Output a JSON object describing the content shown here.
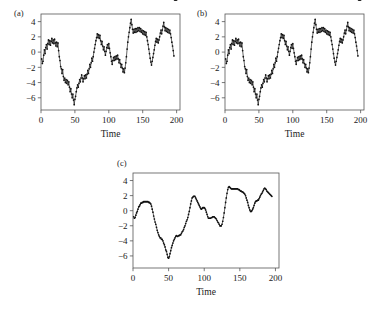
{
  "figure": {
    "background": "#ffffff",
    "ink_color": "#111111",
    "frame_color": "#555555"
  },
  "panels": [
    {
      "id": "a",
      "label": "(a)"
    },
    {
      "id": "b",
      "label": "(b)"
    },
    {
      "id": "c",
      "label": "(c)"
    }
  ],
  "chart_data": [
    {
      "type": "line",
      "panel": "(a)",
      "title": "",
      "xlabel": "Time",
      "ylabel": "",
      "xlim": [
        0,
        205
      ],
      "ylim": [
        -7.6,
        5.0
      ],
      "xticks": [
        0,
        50,
        100,
        150,
        200
      ],
      "yticks": [
        4,
        2,
        0,
        -2,
        -4,
        -6
      ],
      "xticklabels": [
        "0",
        "50",
        "100",
        "150",
        "200"
      ],
      "yticklabels": [
        "4",
        "2",
        "0",
        "-2",
        "-4",
        "-6"
      ],
      "grid": false,
      "legend": null,
      "marker": "dot",
      "x": [
        1,
        2,
        3,
        4,
        5,
        6,
        7,
        8,
        9,
        10,
        11,
        12,
        13,
        14,
        15,
        16,
        17,
        18,
        19,
        20,
        21,
        22,
        23,
        24,
        25,
        26,
        27,
        28,
        29,
        30,
        31,
        32,
        33,
        34,
        35,
        36,
        37,
        38,
        39,
        40,
        41,
        42,
        43,
        44,
        45,
        46,
        47,
        48,
        49,
        50,
        51,
        52,
        53,
        54,
        55,
        56,
        57,
        58,
        59,
        60,
        61,
        62,
        63,
        64,
        65,
        66,
        67,
        68,
        69,
        70,
        71,
        72,
        73,
        74,
        75,
        76,
        77,
        78,
        79,
        80,
        81,
        82,
        83,
        84,
        85,
        86,
        87,
        88,
        89,
        90,
        91,
        92,
        93,
        94,
        95,
        96,
        97,
        98,
        99,
        100,
        101,
        102,
        103,
        104,
        105,
        106,
        107,
        108,
        109,
        110,
        111,
        112,
        113,
        114,
        115,
        116,
        117,
        118,
        119,
        120,
        121,
        122,
        123,
        124,
        125,
        126,
        127,
        128,
        129,
        130,
        131,
        132,
        133,
        134,
        135,
        136,
        137,
        138,
        139,
        140,
        141,
        142,
        143,
        144,
        145,
        146,
        147,
        148,
        149,
        150,
        151,
        152,
        153,
        154,
        155,
        156,
        157,
        158,
        159,
        160,
        161,
        162,
        163,
        164,
        165,
        166,
        167,
        168,
        169,
        170,
        171,
        172,
        173,
        174,
        175,
        176,
        177,
        178,
        179,
        180,
        181,
        182,
        183,
        184,
        185,
        186,
        187,
        188,
        189,
        190,
        191,
        192,
        193,
        194,
        195,
        196,
        197,
        198,
        199,
        200
      ],
      "values": [
        -0.9,
        -1.5,
        -1.2,
        -0.4,
        0.3,
        -0.2,
        0.6,
        1.0,
        0.4,
        1.1,
        1.6,
        1.0,
        1.5,
        0.9,
        1.4,
        1.8,
        1.2,
        1.6,
        1.1,
        1.7,
        1.2,
        0.8,
        1.3,
        0.7,
        1.2,
        0.2,
        -0.6,
        -1.1,
        -1.9,
        -2.2,
        -2.8,
        -2.3,
        -3.2,
        -3.7,
        -3.4,
        -4.0,
        -3.6,
        -4.1,
        -3.7,
        -4.3,
        -3.9,
        -4.6,
        -5.2,
        -4.8,
        -5.5,
        -6.0,
        -5.5,
        -6.3,
        -6.9,
        -6.2,
        -5.8,
        -5.2,
        -4.7,
        -4.3,
        -4.6,
        -4.1,
        -3.6,
        -3.9,
        -3.4,
        -3.0,
        -3.4,
        -3.9,
        -3.5,
        -3.1,
        -3.5,
        -3.0,
        -3.4,
        -2.9,
        -2.4,
        -2.8,
        -2.2,
        -1.6,
        -2.0,
        -1.4,
        -0.8,
        -1.2,
        -0.6,
        0.0,
        0.5,
        1.0,
        1.5,
        1.9,
        2.4,
        1.9,
        2.3,
        1.8,
        2.2,
        1.5,
        1.0,
        1.4,
        0.8,
        0.3,
        0.7,
        0.1,
        -0.4,
        0.1,
        0.6,
        1.0,
        0.5,
        1.1,
        0.5,
        -0.1,
        -0.6,
        -1.2,
        -1.6,
        -1.1,
        -0.7,
        -1.1,
        -0.6,
        -1.0,
        -0.5,
        -0.9,
        -0.4,
        -0.9,
        -1.4,
        -1.0,
        -1.5,
        -2.0,
        -1.6,
        -2.1,
        -2.6,
        -2.2,
        -2.7,
        -2.1,
        -1.4,
        -0.6,
        0.4,
        1.3,
        2.0,
        2.6,
        3.2,
        3.8,
        4.3,
        3.6,
        3.0,
        2.5,
        3.0,
        2.6,
        3.1,
        2.6,
        3.1,
        2.7,
        3.2,
        2.8,
        3.2,
        2.7,
        3.1,
        2.6,
        2.9,
        2.4,
        2.8,
        2.3,
        2.7,
        2.2,
        2.6,
        2.0,
        1.5,
        1.0,
        0.4,
        -0.2,
        -0.8,
        -1.3,
        -1.7,
        -1.2,
        -0.7,
        -0.2,
        0.3,
        0.9,
        1.4,
        1.8,
        1.3,
        1.7,
        1.2,
        1.6,
        2.0,
        2.5,
        2.9,
        2.4,
        2.9,
        3.4,
        3.9,
        3.3,
        2.8,
        3.2,
        2.7,
        3.1,
        2.6,
        3.0,
        2.5,
        2.9,
        2.4,
        1.9,
        1.3,
        0.8,
        0.2,
        -0.5
      ]
    },
    {
      "type": "line",
      "panel": "(b)",
      "title": "",
      "xlabel": "Time",
      "ylabel": "",
      "xlim": [
        0,
        205
      ],
      "ylim": [
        -7.6,
        5.0
      ],
      "xticks": [
        0,
        50,
        100,
        150,
        200
      ],
      "yticks": [
        4,
        2,
        0,
        -2,
        -4,
        -6
      ],
      "xticklabels": [
        "0",
        "50",
        "100",
        "150",
        "200"
      ],
      "yticklabels": [
        "4",
        "2",
        "0",
        "-2",
        "-4",
        "-6"
      ],
      "grid": false,
      "legend": null,
      "marker": "dot",
      "x": [
        1,
        2,
        3,
        4,
        5,
        6,
        7,
        8,
        9,
        10,
        11,
        12,
        13,
        14,
        15,
        16,
        17,
        18,
        19,
        20,
        21,
        22,
        23,
        24,
        25,
        26,
        27,
        28,
        29,
        30,
        31,
        32,
        33,
        34,
        35,
        36,
        37,
        38,
        39,
        40,
        41,
        42,
        43,
        44,
        45,
        46,
        47,
        48,
        49,
        50,
        51,
        52,
        53,
        54,
        55,
        56,
        57,
        58,
        59,
        60,
        61,
        62,
        63,
        64,
        65,
        66,
        67,
        68,
        69,
        70,
        71,
        72,
        73,
        74,
        75,
        76,
        77,
        78,
        79,
        80,
        81,
        82,
        83,
        84,
        85,
        86,
        87,
        88,
        89,
        90,
        91,
        92,
        93,
        94,
        95,
        96,
        97,
        98,
        99,
        100,
        101,
        102,
        103,
        104,
        105,
        106,
        107,
        108,
        109,
        110,
        111,
        112,
        113,
        114,
        115,
        116,
        117,
        118,
        119,
        120,
        121,
        122,
        123,
        124,
        125,
        126,
        127,
        128,
        129,
        130,
        131,
        132,
        133,
        134,
        135,
        136,
        137,
        138,
        139,
        140,
        141,
        142,
        143,
        144,
        145,
        146,
        147,
        148,
        149,
        150,
        151,
        152,
        153,
        154,
        155,
        156,
        157,
        158,
        159,
        160,
        161,
        162,
        163,
        164,
        165,
        166,
        167,
        168,
        169,
        170,
        171,
        172,
        173,
        174,
        175,
        176,
        177,
        178,
        179,
        180,
        181,
        182,
        183,
        184,
        185,
        186,
        187,
        188,
        189,
        190,
        191,
        192,
        193,
        194,
        195,
        196,
        197,
        198,
        199,
        200
      ],
      "values": [
        -0.9,
        -1.5,
        -1.2,
        -0.4,
        0.3,
        -0.2,
        0.6,
        1.0,
        0.4,
        1.1,
        1.6,
        1.0,
        1.5,
        0.9,
        1.4,
        1.8,
        1.2,
        1.6,
        1.1,
        1.7,
        1.2,
        0.8,
        1.3,
        0.7,
        1.2,
        0.2,
        -0.6,
        -1.1,
        -1.9,
        -2.2,
        -2.8,
        -2.3,
        -3.2,
        -3.7,
        -3.4,
        -4.0,
        -3.6,
        -4.1,
        -3.7,
        -4.3,
        -3.9,
        -4.6,
        -5.2,
        -4.8,
        -5.5,
        -6.0,
        -5.5,
        -6.3,
        -6.9,
        -6.2,
        -5.8,
        -5.2,
        -4.7,
        -4.3,
        -4.6,
        -4.1,
        -3.6,
        -3.9,
        -3.4,
        -3.0,
        -3.4,
        -3.9,
        -3.5,
        -3.1,
        -3.5,
        -3.0,
        -3.4,
        -2.9,
        -2.4,
        -2.8,
        -2.2,
        -1.6,
        -2.0,
        -1.4,
        -0.8,
        -1.2,
        -0.6,
        0.0,
        0.5,
        1.0,
        1.5,
        1.9,
        2.4,
        1.9,
        2.3,
        1.8,
        2.2,
        1.5,
        1.0,
        1.4,
        0.8,
        0.3,
        0.7,
        0.1,
        -0.4,
        0.1,
        0.6,
        1.0,
        0.5,
        1.1,
        0.5,
        -0.1,
        -0.6,
        -1.2,
        -1.6,
        -1.1,
        -0.7,
        -1.1,
        -0.6,
        -1.0,
        -0.5,
        -0.9,
        -0.4,
        -0.9,
        -1.4,
        -1.0,
        -1.5,
        -2.0,
        -1.6,
        -2.1,
        -2.6,
        -2.2,
        -2.7,
        -2.1,
        -1.4,
        -0.6,
        0.4,
        1.3,
        2.0,
        2.6,
        3.2,
        3.8,
        4.3,
        3.6,
        3.0,
        2.5,
        3.0,
        2.6,
        3.1,
        2.6,
        3.1,
        2.7,
        3.2,
        2.8,
        3.2,
        2.7,
        3.1,
        2.6,
        2.9,
        2.4,
        2.8,
        2.3,
        2.7,
        2.2,
        2.6,
        2.0,
        1.5,
        1.0,
        0.4,
        -0.2,
        -0.8,
        -1.3,
        -1.7,
        -1.2,
        -0.7,
        -0.2,
        0.3,
        0.9,
        1.4,
        1.8,
        1.3,
        1.7,
        1.2,
        1.6,
        2.0,
        2.5,
        2.9,
        2.4,
        2.9,
        3.4,
        3.9,
        3.3,
        2.8,
        3.2,
        2.7,
        3.1,
        2.6,
        3.0,
        2.5,
        2.9,
        2.4,
        1.9,
        1.3,
        0.8,
        0.2,
        -0.5
      ]
    },
    {
      "type": "line",
      "panel": "(c)",
      "title": "",
      "xlabel": "Time",
      "ylabel": "",
      "xlim": [
        0,
        205
      ],
      "ylim": [
        -7.6,
        5.0
      ],
      "xticks": [
        0,
        50,
        100,
        150,
        200
      ],
      "yticks": [
        4,
        2,
        0,
        -2,
        -4,
        -6
      ],
      "xticklabels": [
        "0",
        "50",
        "100",
        "150",
        "200"
      ],
      "yticklabels": [
        "4",
        "2",
        "0",
        "-2",
        "-4",
        "-6"
      ],
      "grid": false,
      "legend": null,
      "marker": "dot",
      "note": "smoothed version of the series in panels (a) and (b)",
      "x": [
        1,
        2,
        3,
        4,
        5,
        6,
        7,
        8,
        9,
        10,
        11,
        12,
        13,
        14,
        15,
        16,
        17,
        18,
        19,
        20,
        21,
        22,
        23,
        24,
        25,
        26,
        27,
        28,
        29,
        30,
        31,
        32,
        33,
        34,
        35,
        36,
        37,
        38,
        39,
        40,
        41,
        42,
        43,
        44,
        45,
        46,
        47,
        48,
        49,
        50,
        51,
        52,
        53,
        54,
        55,
        56,
        57,
        58,
        59,
        60,
        61,
        62,
        63,
        64,
        65,
        66,
        67,
        68,
        69,
        70,
        71,
        72,
        73,
        74,
        75,
        76,
        77,
        78,
        79,
        80,
        81,
        82,
        83,
        84,
        85,
        86,
        87,
        88,
        89,
        90,
        91,
        92,
        93,
        94,
        95,
        96,
        97,
        98,
        99,
        100,
        101,
        102,
        103,
        104,
        105,
        106,
        107,
        108,
        109,
        110,
        111,
        112,
        113,
        114,
        115,
        116,
        117,
        118,
        119,
        120,
        121,
        122,
        123,
        124,
        125,
        126,
        127,
        128,
        129,
        130,
        131,
        132,
        133,
        134,
        135,
        136,
        137,
        138,
        139,
        140,
        141,
        142,
        143,
        144,
        145,
        146,
        147,
        148,
        149,
        150,
        151,
        152,
        153,
        154,
        155,
        156,
        157,
        158,
        159,
        160,
        161,
        162,
        163,
        164,
        165,
        166,
        167,
        168,
        169,
        170,
        171,
        172,
        173,
        174,
        175,
        176,
        177,
        178,
        179,
        180,
        181,
        182,
        183,
        184,
        185,
        186,
        187,
        188,
        189,
        190,
        191,
        192,
        193,
        194,
        195
      ],
      "values": [
        -0.8,
        -1.0,
        -0.9,
        -0.6,
        -0.3,
        -0.1,
        0.2,
        0.5,
        0.6,
        0.8,
        1.0,
        1.0,
        1.1,
        1.1,
        1.2,
        1.2,
        1.2,
        1.2,
        1.2,
        1.2,
        1.2,
        1.1,
        1.1,
        1.0,
        0.9,
        0.6,
        0.2,
        -0.2,
        -0.7,
        -1.1,
        -1.5,
        -1.8,
        -2.2,
        -2.6,
        -2.9,
        -3.2,
        -3.4,
        -3.6,
        -3.6,
        -3.8,
        -3.8,
        -4.0,
        -4.3,
        -4.5,
        -4.8,
        -5.2,
        -5.4,
        -5.8,
        -6.2,
        -6.3,
        -6.1,
        -5.7,
        -5.3,
        -4.9,
        -4.6,
        -4.3,
        -4.0,
        -3.8,
        -3.6,
        -3.4,
        -3.3,
        -3.4,
        -3.4,
        -3.3,
        -3.3,
        -3.2,
        -3.2,
        -3.0,
        -2.8,
        -2.7,
        -2.5,
        -2.2,
        -2.0,
        -1.7,
        -1.4,
        -1.2,
        -0.9,
        -0.5,
        -0.1,
        0.4,
        0.9,
        1.3,
        1.7,
        1.8,
        1.9,
        1.9,
        1.9,
        1.7,
        1.5,
        1.3,
        1.1,
        0.9,
        0.7,
        0.5,
        0.3,
        0.2,
        0.3,
        0.4,
        0.4,
        0.4,
        0.3,
        0.1,
        -0.2,
        -0.5,
        -0.8,
        -1.0,
        -1.0,
        -1.0,
        -1.0,
        -0.9,
        -0.9,
        -0.8,
        -0.8,
        -0.8,
        -0.9,
        -1.0,
        -1.1,
        -1.3,
        -1.5,
        -1.6,
        -1.8,
        -2.0,
        -2.0,
        -2.0,
        -1.8,
        -1.4,
        -0.9,
        -0.3,
        0.4,
        1.1,
        1.7,
        2.3,
        2.8,
        3.1,
        3.2,
        3.1,
        3.0,
        2.9,
        2.9,
        2.9,
        2.9,
        2.9,
        2.9,
        2.9,
        2.9,
        2.9,
        2.9,
        2.8,
        2.8,
        2.7,
        2.6,
        2.6,
        2.5,
        2.5,
        2.4,
        2.3,
        2.2,
        2.0,
        1.7,
        1.4,
        1.1,
        0.7,
        0.4,
        0.1,
        -0.1,
        -0.1,
        0.0,
        0.2,
        0.4,
        0.7,
        1.0,
        1.2,
        1.3,
        1.3,
        1.4,
        1.4,
        1.6,
        1.8,
        2.0,
        2.2,
        2.3,
        2.5,
        2.7,
        2.9,
        3.0,
        2.9,
        2.8,
        2.6,
        2.5,
        2.4,
        2.3,
        2.2,
        2.1,
        2.0,
        1.9,
        1.7,
        1.5,
        1.4,
        1.3
      ]
    }
  ]
}
